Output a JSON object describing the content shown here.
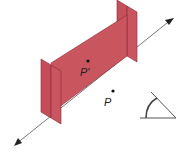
{
  "figure": {
    "colors": {
      "plane_fill": "#c8535e",
      "plane_edge": "#8e2a35",
      "axis": "#777777",
      "dot": "#111111"
    },
    "points": [
      {
        "label": "P'",
        "role": "reflected-point"
      },
      {
        "label": "P",
        "role": "original-point"
      }
    ],
    "icons": [
      "angle-icon"
    ],
    "axis": {
      "arrows": [
        "both-ends"
      ]
    }
  }
}
